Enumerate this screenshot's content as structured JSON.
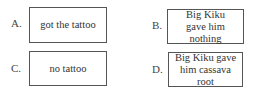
{
  "options": [
    {
      "letter": "A.",
      "text": "got the tattoo"
    },
    {
      "letter": "B.",
      "text": "Big Kiku gave him nothing"
    },
    {
      "letter": "C.",
      "text": "no tattoo"
    },
    {
      "letter": "D.",
      "text": "Big Kiku gave him cassava root"
    }
  ]
}
